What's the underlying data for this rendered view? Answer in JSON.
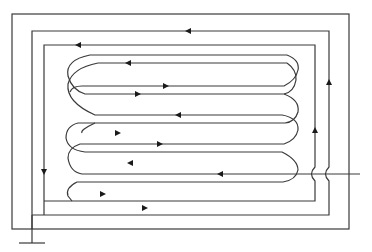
{
  "diagram": {
    "type": "serpentine-heating-coil-schematic",
    "colors": {
      "stroke": "#3a3a3a",
      "arrow": "#1a1a1a",
      "background": "#ffffff"
    },
    "outer_frame": {
      "x1": 12,
      "y1": 14,
      "x2": 349,
      "y2": 229
    },
    "ground_terminal": {
      "x": 32,
      "y_top": 229,
      "y_bottom": 243,
      "bar_x1": 19,
      "bar_x2": 45
    },
    "input_lead": {
      "x1": 236,
      "x2": 360,
      "y": 174
    },
    "arrows": [
      {
        "id": "a1",
        "x": 188,
        "y": 31,
        "dir": "left"
      },
      {
        "id": "a2",
        "x": 78,
        "y": 45,
        "dir": "left"
      },
      {
        "id": "a3",
        "x": 128,
        "y": 63,
        "dir": "left"
      },
      {
        "id": "a4",
        "x": 166,
        "y": 86,
        "dir": "right"
      },
      {
        "id": "a5",
        "x": 138,
        "y": 94,
        "dir": "right"
      },
      {
        "id": "a6",
        "x": 178,
        "y": 115,
        "dir": "left"
      },
      {
        "id": "a7",
        "x": 118,
        "y": 133,
        "dir": "right"
      },
      {
        "id": "a8",
        "x": 160,
        "y": 144,
        "dir": "right"
      },
      {
        "id": "a9",
        "x": 130,
        "y": 163,
        "dir": "left"
      },
      {
        "id": "a10",
        "x": 220,
        "y": 174,
        "dir": "left"
      },
      {
        "id": "a11",
        "x": 103,
        "y": 194,
        "dir": "right"
      },
      {
        "id": "a12",
        "x": 145,
        "y": 208,
        "dir": "right"
      },
      {
        "id": "a13",
        "x": 44,
        "y": 172,
        "dir": "down"
      },
      {
        "id": "a14",
        "x": 315,
        "y": 130,
        "dir": "up"
      },
      {
        "id": "a15",
        "x": 329,
        "y": 82,
        "dir": "up"
      }
    ]
  }
}
